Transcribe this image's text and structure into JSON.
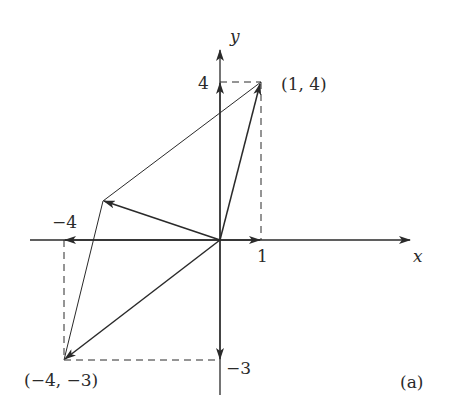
{
  "figure": {
    "panel_label": "(a)",
    "axes": {
      "x_label": "x",
      "y_label": "y",
      "x_ticks": [
        {
          "value": -4,
          "label": "−4"
        },
        {
          "value": 1,
          "label": "1"
        }
      ],
      "y_ticks": [
        {
          "value": 4,
          "label": "4"
        },
        {
          "value": -3,
          "label": "−3"
        }
      ]
    },
    "points": [
      {
        "name": "p1",
        "label": "(1, 4)",
        "x": 1,
        "y": 4
      },
      {
        "name": "p2",
        "label": "(−4, −3)",
        "x": -4,
        "y": -3
      }
    ],
    "vectors": [
      {
        "name": "v1",
        "from": [
          0,
          0
        ],
        "to": [
          1,
          4
        ]
      },
      {
        "name": "v2",
        "from": [
          0,
          0
        ],
        "to": [
          -4,
          -3
        ]
      },
      {
        "name": "v-sum",
        "from": [
          0,
          0
        ],
        "to": [
          -3,
          1
        ]
      },
      {
        "name": "x-comp-1",
        "from": [
          0,
          0
        ],
        "to": [
          1,
          0
        ]
      },
      {
        "name": "y-comp-4",
        "from": [
          0,
          0
        ],
        "to": [
          0,
          4
        ]
      },
      {
        "name": "x-comp-neg4",
        "from": [
          0,
          0
        ],
        "to": [
          -4,
          0
        ]
      },
      {
        "name": "y-comp-neg3",
        "from": [
          0,
          0
        ],
        "to": [
          0,
          -3
        ]
      }
    ],
    "parallelogram": [
      [
        0,
        0
      ],
      [
        1,
        4
      ],
      [
        -3,
        1
      ],
      [
        -4,
        -3
      ]
    ],
    "colors": {
      "ink": "#2a2a2a",
      "background": "#ffffff"
    }
  }
}
